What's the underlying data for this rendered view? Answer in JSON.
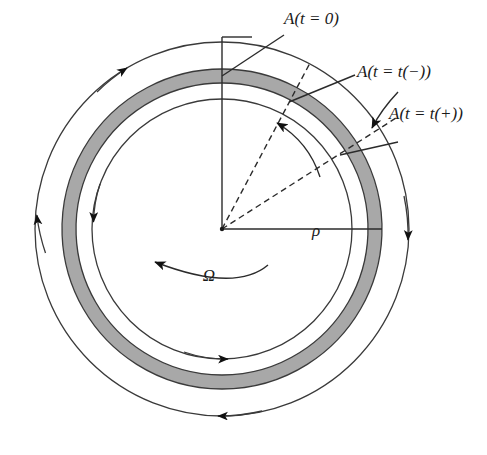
{
  "figure": {
    "background": "#ffffff",
    "width": 487,
    "height": 455
  },
  "geometry": {
    "center_x": 222,
    "center_y": 229,
    "inner_circle_radius": 130,
    "band_inner_radius": 146,
    "band_outer_radius": 160,
    "outer_circle_radius": 187,
    "band_fill_color": "#a8a8a8",
    "line_color": "#2b2b2b"
  },
  "labels": {
    "a_t0": "A(t = 0)",
    "a_t_minus": "A(t = t(−))",
    "a_t_plus": "A(t = t(+))",
    "rho": "ρ",
    "omega": "Ω"
  },
  "annotations": {
    "a_t0_angle_deg": 70,
    "a_t_minus_angle_deg": 55,
    "a_t_plus_angle_deg": 35,
    "omega_direction": "counterclockwise",
    "outer_flow_direction": "clockwise",
    "inner_flow_direction": "counterclockwise"
  },
  "arrows": {
    "outer_left": "up",
    "outer_right": "down",
    "outer_bottom": "left",
    "inner_left": "down",
    "inner_bottom": "right",
    "sweep_arc": "counterclockwise"
  }
}
